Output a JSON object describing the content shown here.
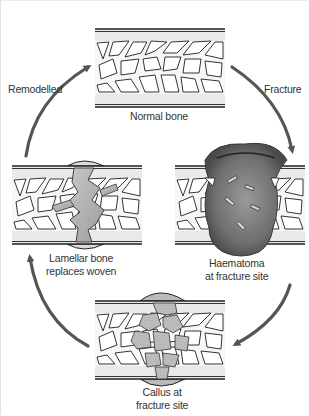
{
  "diagram": {
    "type": "cycle",
    "colors": {
      "arrow": "#555555",
      "bone_outline": "#222222",
      "cortex_fill": "#e8e8e8",
      "haematoma": "#6e6e6e",
      "callus": "#b5b5b5",
      "lamellar": "#a8a8a8",
      "text": "#333333"
    },
    "stages": [
      {
        "id": "normal",
        "position": "top",
        "label_lines": [
          "Normal bone"
        ]
      },
      {
        "id": "haematoma",
        "position": "right",
        "label_lines": [
          "Haematoma",
          "at fracture site"
        ]
      },
      {
        "id": "callus",
        "position": "bottom",
        "label_lines": [
          "Callus at",
          "fracture site"
        ]
      },
      {
        "id": "lamellar",
        "position": "left",
        "label_lines": [
          "Lamellar bone",
          "replaces woven"
        ]
      }
    ],
    "arrows": [
      {
        "from": "normal",
        "to": "haematoma",
        "label": "Fracture"
      },
      {
        "from": "haematoma",
        "to": "callus",
        "label": ""
      },
      {
        "from": "callus",
        "to": "lamellar",
        "label": ""
      },
      {
        "from": "lamellar",
        "to": "normal",
        "label": "Remodelled"
      }
    ]
  }
}
